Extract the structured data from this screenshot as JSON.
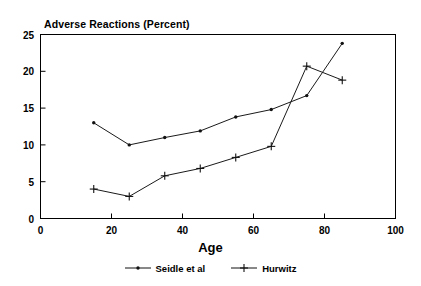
{
  "chart_data": {
    "type": "line",
    "title": "Adverse Reactions (Percent)",
    "xlabel": "Age",
    "ylabel": "",
    "xlim": [
      0,
      100
    ],
    "ylim": [
      0,
      25
    ],
    "xticks": [
      0,
      20,
      40,
      60,
      80,
      100
    ],
    "yticks": [
      0,
      5,
      10,
      15,
      20,
      25
    ],
    "xtick_labels": [
      "0",
      "20",
      "40",
      "60",
      "80",
      "100"
    ],
    "ytick_labels": [
      "0",
      "5",
      "10",
      "15",
      "20",
      "25"
    ],
    "grid": false,
    "legend_position": "bottom",
    "x": [
      15,
      25,
      35,
      45,
      55,
      65,
      75,
      85
    ],
    "series": [
      {
        "name": "Seidle et al",
        "marker": "dot",
        "color": "#111111",
        "values": [
          13.0,
          10.0,
          11.0,
          11.9,
          13.8,
          14.8,
          16.7,
          23.8
        ]
      },
      {
        "name": "Hurwitz",
        "marker": "plus",
        "color": "#111111",
        "values": [
          4.0,
          3.0,
          5.8,
          6.8,
          8.3,
          9.8,
          20.7,
          18.8
        ]
      }
    ]
  },
  "legend": {
    "entries": [
      {
        "label": "Seidle et al",
        "marker": "dot-marker-icon"
      },
      {
        "label": "Hurwitz",
        "marker": "plus-marker-icon"
      }
    ]
  }
}
